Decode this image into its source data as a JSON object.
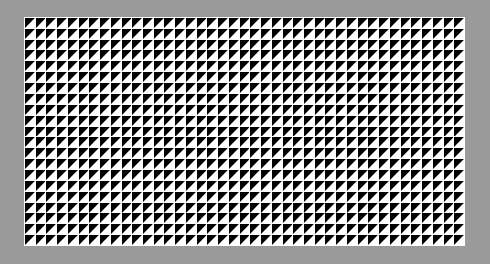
{
  "image": {
    "title": "Triangle Grid Pattern",
    "width": 490,
    "height": 264,
    "background_color": "#9a9a9a"
  },
  "panel": {
    "name": "pattern-panel",
    "x": 24,
    "y": 17,
    "width": 441,
    "height": 229,
    "background_color": "#ffffff"
  },
  "pattern": {
    "type": "triangle-grid",
    "columns": 41,
    "rows": 21,
    "cell_width": 10.76,
    "cell_height": 10.9,
    "triangle_color": "#000000",
    "cell_background_color": "#ffffff",
    "gap_px": 0.9,
    "triangle_orientation": "upper-left",
    "triangle_vertices": "top-left, top-right, bottom-left",
    "description": "Uniform grid of black right triangles filling the upper-left half of each white square cell, with thin white gaps forming a lattice."
  }
}
